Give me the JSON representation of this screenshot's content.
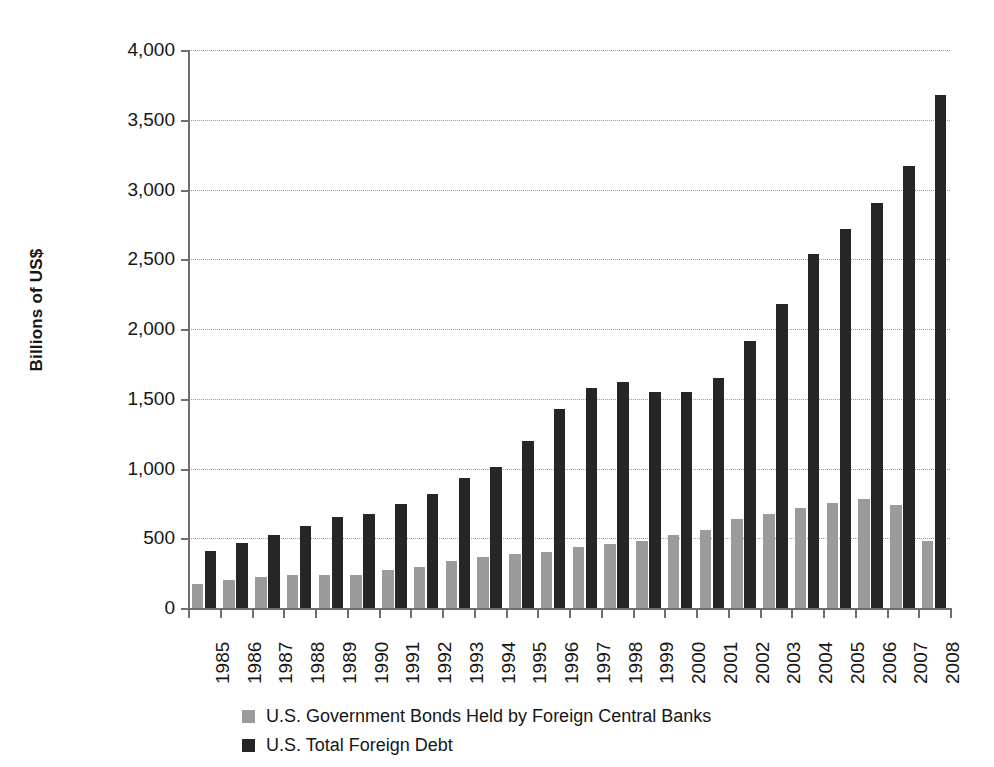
{
  "chart_data": {
    "type": "bar",
    "title": "",
    "subtitle": "",
    "xlabel": "",
    "ylabel": "Billions of US$",
    "ylim": [
      0,
      4000
    ],
    "ytick_labels": [
      "0",
      "500",
      "1,000",
      "1,500",
      "2,000",
      "2,500",
      "3,000",
      "3,500",
      "4,000"
    ],
    "ytick_values": [
      0,
      500,
      1000,
      1500,
      2000,
      2500,
      3000,
      3500,
      4000
    ],
    "grid": true,
    "legend_position": "bottom-left",
    "categories": [
      "1985",
      "1986",
      "1987",
      "1988",
      "1989",
      "1990",
      "1991",
      "1992",
      "1993",
      "1994",
      "1995",
      "1996",
      "1997",
      "1998",
      "1999",
      "2000",
      "2001",
      "2002",
      "2003",
      "2004",
      "2005",
      "2006",
      "2007",
      "2008"
    ],
    "series": [
      {
        "name": "U.S. Government Bonds Held by Foreign Central Banks",
        "color": "#9b9b9b",
        "values": [
          175,
          200,
          225,
          235,
          235,
          240,
          275,
          295,
          340,
          365,
          385,
          400,
          435,
          460,
          480,
          520,
          560,
          640,
          675,
          720,
          755,
          780,
          740,
          480
        ]
      },
      {
        "name": "U.S. Total Foreign Debt",
        "color": "#262626",
        "values": [
          410,
          465,
          525,
          590,
          655,
          675,
          745,
          815,
          935,
          1010,
          1195,
          1430,
          1580,
          1620,
          1545,
          1545,
          1650,
          1915,
          2180,
          2535,
          2720,
          2905,
          3165,
          3680
        ]
      }
    ]
  },
  "legend": {
    "items": [
      {
        "label": "U.S. Government Bonds Held by Foreign Central Banks",
        "swatch": "series-0"
      },
      {
        "label": "U.S. Total Foreign Debt",
        "swatch": "series-1"
      }
    ]
  },
  "colors": {
    "series_0": "#9b9b9b",
    "series_1": "#262626",
    "axis": "#6e6e6e",
    "grid": "#9a9a9a",
    "text": "#161616",
    "background": "#ffffff"
  }
}
